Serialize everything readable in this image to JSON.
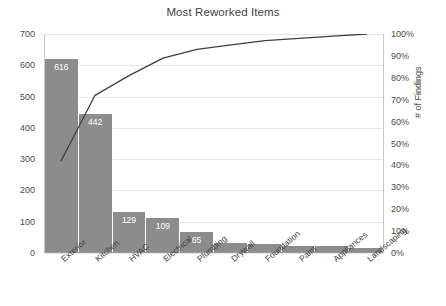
{
  "chart_data": {
    "type": "bar",
    "title": "Most Reworked Items",
    "xlabel": "",
    "ylabel": "",
    "y2label": "# of Findings",
    "categories": [
      "Exterior",
      "Kitchen",
      "HVAC",
      "Electrical",
      "Plumbing",
      "Drywall",
      "Foundation",
      "Paint",
      "Appliances",
      "Landscaping"
    ],
    "values": [
      616,
      442,
      129,
      109,
      65,
      30,
      27,
      18,
      18,
      12
    ],
    "series": [
      {
        "name": "Count",
        "type": "bar",
        "values": [
          616,
          442,
          129,
          109,
          65,
          30,
          27,
          18,
          18,
          12
        ]
      },
      {
        "name": "Cumulative %",
        "type": "line",
        "values": [
          42,
          72,
          81,
          89,
          93,
          95,
          97,
          98,
          99,
          100
        ]
      }
    ],
    "ylim": [
      0,
      700
    ],
    "y2lim": [
      0,
      100
    ],
    "yticks": [
      "0",
      "100",
      "200",
      "300",
      "400",
      "500",
      "600",
      "700"
    ],
    "y2ticks": [
      "0%",
      "10%",
      "20%",
      "30%",
      "40%",
      "50%",
      "60%",
      "70%",
      "80%",
      "90%",
      "100%"
    ],
    "grid": true,
    "legend": "none",
    "colors": {
      "bar": "#8c8c8c",
      "line": "#3f3f3f",
      "grid": "#e6e6e6",
      "text": "#3f3f3f"
    }
  }
}
